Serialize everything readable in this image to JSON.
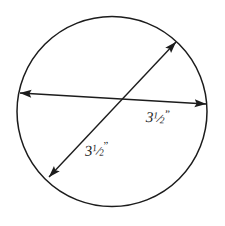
{
  "figure": {
    "background_color": "#ffffff",
    "stroke_color": "#1c1c1c",
    "text_color": "#1c1c1c",
    "width": 225,
    "height": 226
  },
  "circle": {
    "center_x": 112,
    "center_y": 111,
    "radius": 95,
    "stroke_width": 1.5
  },
  "diameters": [
    {
      "name": "horizontal-diameter",
      "x1": 20,
      "y1": 93,
      "x2": 206,
      "y2": 104,
      "arrowheads": "both",
      "stroke_width": 1.4
    },
    {
      "name": "diagonal-diameter",
      "x1": 49,
      "y1": 177,
      "x2": 176,
      "y2": 42,
      "arrowheads": "both",
      "stroke_width": 1.4
    }
  ],
  "labels": {
    "horizontal": {
      "whole": "3",
      "numerator": "1",
      "fraction_bar": "/",
      "denominator": "2",
      "unit": "”",
      "full_text": "3½”",
      "value": 3.5,
      "unit_name": "inches"
    },
    "diagonal": {
      "whole": "3",
      "numerator": "1",
      "fraction_bar": "/",
      "denominator": "2",
      "unit": "”",
      "full_text": "3½”",
      "value": 3.5,
      "unit_name": "inches"
    }
  }
}
